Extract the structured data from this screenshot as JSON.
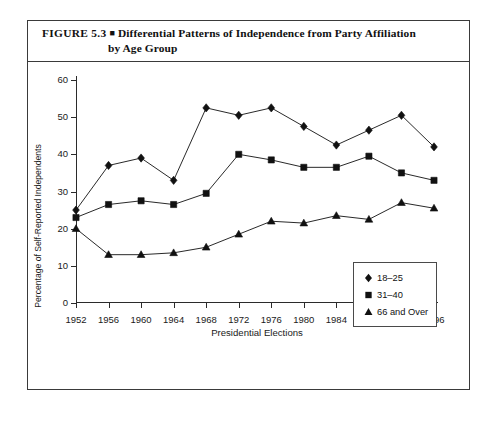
{
  "figure": {
    "number": "FIGURE 5.3",
    "bullet": "■",
    "title_line1": "Differential Patterns of Independence from Party Affiliation",
    "title_line2": "by Age Group"
  },
  "chart_data": {
    "type": "line",
    "title": "Differential Patterns of Independence from Party Affiliation by Age Group",
    "xlabel": "Presidential Elections",
    "ylabel": "Percentage of Self-Reported Independents",
    "categories": [
      "1952",
      "1956",
      "1960",
      "1964",
      "1968",
      "1972",
      "1976",
      "1980",
      "1984",
      "1988",
      "1992",
      "1996"
    ],
    "x_tick_labels": [
      "1952",
      "1956",
      "1960",
      "1964",
      "1968",
      "1972",
      "1976",
      "1980",
      "1984",
      "1988",
      "1992",
      "1996"
    ],
    "y_tick_labels": [
      "0",
      "10",
      "20",
      "30",
      "40",
      "50",
      "60"
    ],
    "y_ticks": [
      0,
      10,
      20,
      30,
      40,
      50,
      60
    ],
    "ylim": [
      0,
      60
    ],
    "grid": false,
    "legend_position": "inside lower right",
    "series": [
      {
        "name": "18–25",
        "marker": "diamond",
        "color": "#111111",
        "values": [
          25,
          37,
          39,
          33,
          52.5,
          50.5,
          52.5,
          47.5,
          42.5,
          46.5,
          50.5,
          42
        ]
      },
      {
        "name": "31–40",
        "marker": "square",
        "color": "#111111",
        "values": [
          23,
          26.5,
          27.5,
          26.5,
          29.5,
          40,
          38.5,
          36.5,
          36.5,
          39.5,
          35,
          33
        ]
      },
      {
        "name": "66 and Over",
        "marker": "triangle",
        "color": "#111111",
        "values": [
          20,
          13,
          13,
          13.5,
          15,
          18.5,
          22,
          21.5,
          23.5,
          22.5,
          27,
          25.5
        ]
      }
    ]
  },
  "legend": {
    "items": [
      {
        "label": "18–25",
        "marker": "diamond"
      },
      {
        "label": "31–40",
        "marker": "square"
      },
      {
        "label": "66 and Over",
        "marker": "triangle"
      }
    ]
  }
}
